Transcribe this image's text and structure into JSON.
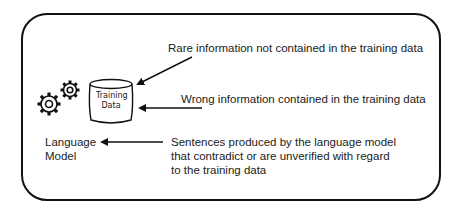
{
  "diagram": {
    "container": "rounded-rectangle",
    "nodes": {
      "training_data": {
        "label_line1": "Training",
        "label_line2": "Data",
        "shape": "cylinder"
      },
      "language_model": {
        "label_line1": "Language",
        "label_line2": "Model",
        "icon": "gears-icon"
      }
    },
    "annotations": [
      {
        "id": "rare",
        "text": "Rare information not contained in the training data",
        "points_to": "training_data"
      },
      {
        "id": "wrong",
        "text": "Wrong information contained in the training data",
        "points_to": "training_data"
      },
      {
        "id": "sentences",
        "line1": "Sentences produced by the language model",
        "line2": "that contradict or are unverified with regard",
        "line3": "to the training data",
        "points_to": "language_model"
      }
    ],
    "colors": {
      "stroke": "#111111",
      "text": "#222222",
      "background": "#ffffff"
    }
  }
}
